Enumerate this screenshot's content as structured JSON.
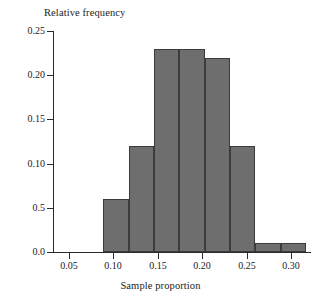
{
  "chart_data": {
    "type": "bar",
    "title": "",
    "xlabel": "Sample proportion",
    "ylabel": "Relative frequency",
    "grid": false,
    "legend": false,
    "xlim": [
      0.032,
      0.322
    ],
    "ylim": [
      0.0,
      0.25
    ],
    "bin_width": 0.0285,
    "bin_edges": [
      0.0885,
      0.117,
      0.1455,
      0.174,
      0.2025,
      0.231,
      0.2595,
      0.288
    ],
    "categories": [
      "0.089-0.117",
      "0.117-0.146",
      "0.146-0.174",
      "0.174-0.203",
      "0.203-0.231",
      "0.231-0.260",
      "0.260-0.288",
      "0.288-0.317"
    ],
    "values": [
      0.06,
      0.12,
      0.23,
      0.23,
      0.22,
      0.12,
      0.01,
      0.01
    ],
    "x_tick_labels": [
      "0.05",
      "0.10",
      "0.15",
      "0.20",
      "0.25",
      "0.30"
    ],
    "x_tick_values": [
      0.05,
      0.1,
      0.15,
      0.2,
      0.25,
      0.3
    ],
    "y_tick_labels": [
      "0.25",
      "0.20",
      "0.15",
      "0.10",
      "0.5",
      "0.0"
    ],
    "y_tick_values": [
      0.25,
      0.2,
      0.15,
      0.1,
      0.05,
      0.0
    ],
    "bar_fill_color": "#6e6e6e",
    "bar_border_color": "#3b3b3b",
    "axis_color": "#2b2b2b",
    "background_color": "#ffffff"
  }
}
